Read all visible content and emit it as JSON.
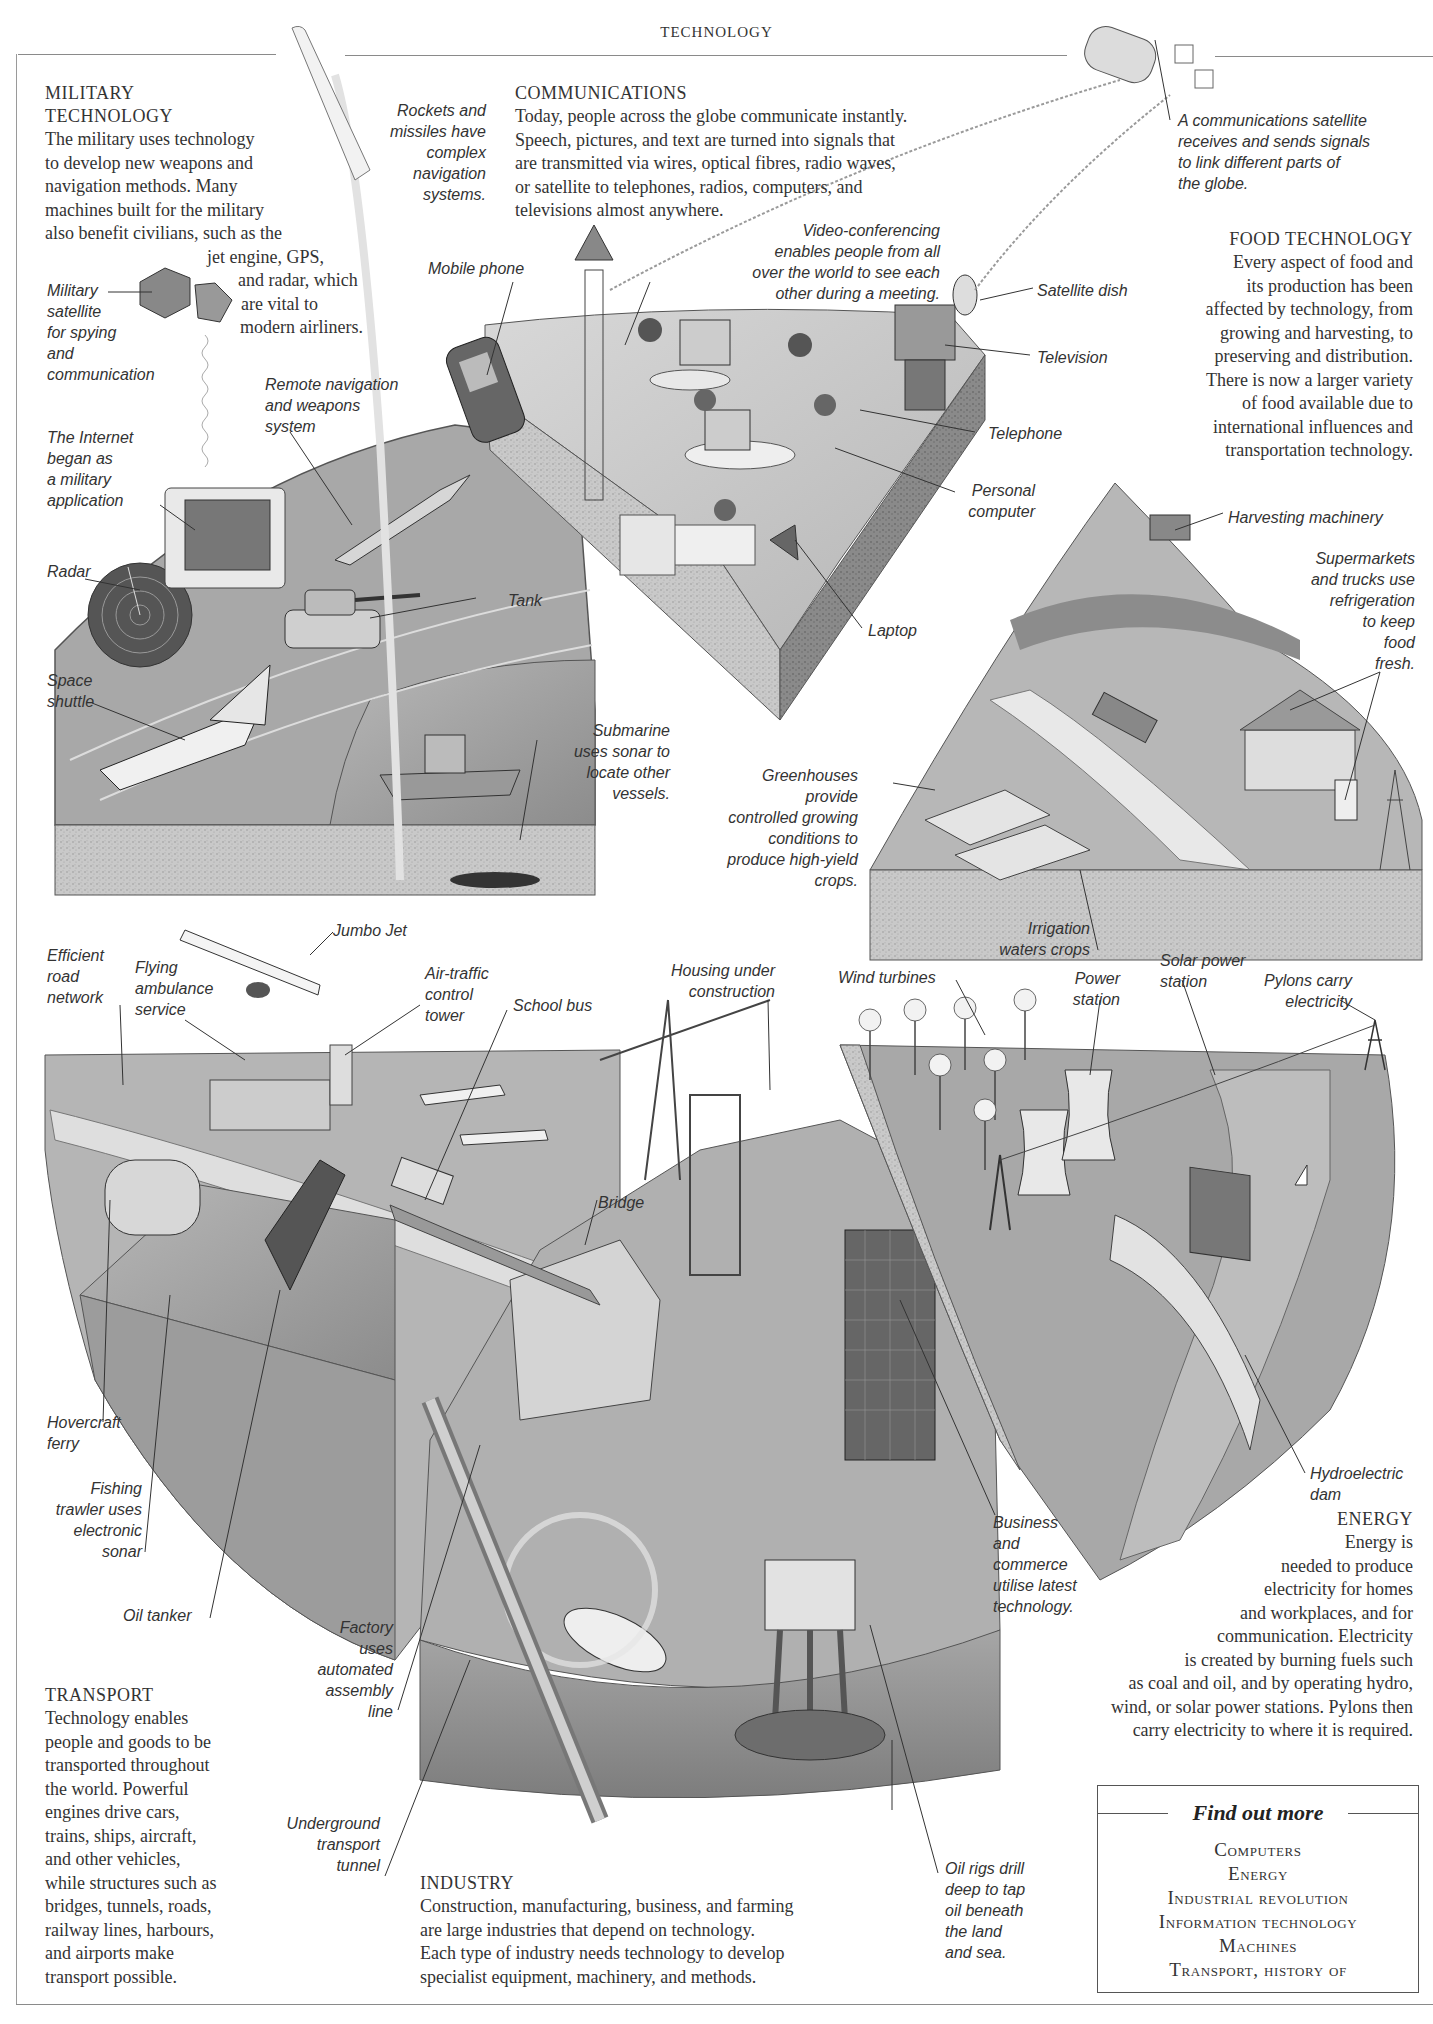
{
  "page": {
    "running_head": "TECHNOLOGY"
  },
  "sections": {
    "military": {
      "heading_line1": "MILITARY",
      "heading_line2": "TECHNOLOGY",
      "body_lines": [
        "The military uses technology",
        "to develop new weapons and",
        "navigation methods. Many",
        "machines built for the military",
        "also benefit civilians, such as the",
        "jet engine, GPS,",
        "and radar, which",
        "are vital to",
        "modern airliners."
      ]
    },
    "communications": {
      "heading": "COMMUNICATIONS",
      "body_lines": [
        "Today, people across the globe communicate instantly.",
        "Speech, pictures, and text are turned into signals that",
        "are transmitted via wires, optical fibres, radio waves,",
        "or satellite to telephones, radios, computers, and",
        "televisions almost anywhere."
      ]
    },
    "food": {
      "heading": "FOOD TECHNOLOGY",
      "body_lines": [
        "Every aspect of food and",
        "its production has been",
        "affected by technology, from",
        "growing and harvesting, to",
        "preserving and distribution.",
        "There is now a larger variety",
        "of food available due to",
        "international influences and",
        "transportation technology."
      ]
    },
    "energy": {
      "heading": "ENERGY",
      "body_lines": [
        "Energy is",
        "needed to produce",
        "electricity for homes",
        "and workplaces, and for",
        "communication. Electricity",
        "is created by burning fuels such",
        "as coal and oil, and by operating hydro,",
        "wind, or solar power stations. Pylons then",
        "carry electricity to where it is required."
      ]
    },
    "transport": {
      "heading": "TRANSPORT",
      "body_lines": [
        "Technology enables",
        "people and goods to be",
        "transported throughout",
        "the world. Powerful",
        "engines drive cars,",
        "trains, ships, aircraft,",
        "and other vehicles,",
        "while structures such as",
        "bridges, tunnels, roads,",
        "railway lines, harbours,",
        "and airports make",
        "transport possible."
      ]
    },
    "industry": {
      "heading": "INDUSTRY",
      "body_lines": [
        "Construction, manufacturing, business, and farming",
        "are large industries that depend on technology.",
        "Each type of industry needs technology to develop",
        "specialist equipment, machinery, and methods."
      ]
    }
  },
  "captions": {
    "rockets": "Rockets and\n missiles have\ncomplex\n   navigation\n    systems.",
    "military_satellite": "Military\nsatellite\nfor spying\nand\ncommunication",
    "remote_navigation": "Remote navigation\nand weapons\nsystem",
    "internet": "The Internet\nbegan as\na military\napplication",
    "radar": "Radar",
    "tank": "Tank",
    "space_shuttle": "Space\nshuttle",
    "submarine": "Submarine\n uses sonar to\n   locate other\n    vessels.",
    "comm_satellite": "A communications satellite\nreceives and sends signals\nto link different parts of\nthe globe.",
    "mobile_phone": "Mobile phone",
    "video_conferencing": "Video-conferencing\nenables people from all\nover the world to see each\nother during a meeting.",
    "satellite_dish": "Satellite dish",
    "television": "Television",
    "telephone": "Telephone",
    "personal_computer": "Personal\ncomputer",
    "laptop": "Laptop",
    "harvesting_machinery": "Harvesting machinery",
    "supermarkets": "Supermarkets\nand trucks use\nrefrigeration\nto keep\nfood\nfresh.",
    "greenhouses": "Greenhouses\nprovide\ncontrolled growing\nconditions to\nproduce high-yield\ncrops.",
    "irrigation": "Irrigation\nwaters crops",
    "jumbo_jet": "Jumbo Jet",
    "efficient_road": "Efficient\nroad\nnetwork",
    "flying_ambulance": "Flying\nambulance\nservice",
    "air_traffic": "Air-traffic\ncontrol\ntower",
    "school_bus": "School bus",
    "housing": "Housing under\nconstruction",
    "wind_turbines": "Wind turbines",
    "power_station": "Power\nstation",
    "solar_power": "Solar power\nstation",
    "pylons": "Pylons carry\nelectricity",
    "bridge": "Bridge",
    "hovercraft": "Hovercraft\nferry",
    "fishing_trawler": "Fishing\ntrawler uses\nelectronic\nsonar",
    "oil_tanker": "Oil tanker",
    "factory": "Factory\nuses\nautomated\nassembly\nline",
    "underground": "Underground\ntransport\ntunnel",
    "business": "Business\nand\ncommerce\nutilise latest\ntechnology.",
    "hydroelectric": "Hydroelectric\ndam",
    "oil_rigs": "Oil rigs drill\ndeep to tap\noil beneath\nthe land\nand sea."
  },
  "find_out_more": {
    "title": "Find out more",
    "items": [
      "Computers",
      "Energy",
      "Industrial revolution",
      "Information technology",
      "Machines",
      "Transport, history of"
    ]
  },
  "colors": {
    "ink": "#2b2b2b",
    "rule": "#8a8a8a",
    "ground_light": "#cfcfcf",
    "ground_mid": "#a9a9a9",
    "ground_dark": "#7e7e7e",
    "soil": "#bdbdbd"
  }
}
